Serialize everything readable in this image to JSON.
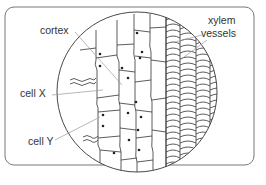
{
  "diagram": {
    "labels": {
      "cortex": "cortex",
      "cell_x": "cell X",
      "cell_y": "cell Y",
      "xylem_line1": "xylem",
      "xylem_line2": "vessels"
    },
    "colors": {
      "stroke": "#333333",
      "frame": "#666666",
      "label_text": "#333333",
      "leader_line": "#999999"
    }
  }
}
